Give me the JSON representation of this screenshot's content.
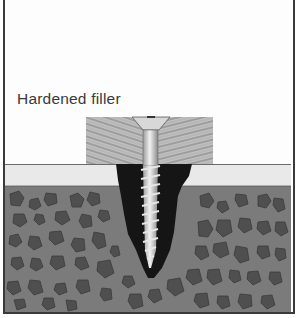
{
  "figure": {
    "label": "Hardened filler",
    "parts": [
      "wood-block",
      "screw",
      "hardened-filler-plug",
      "surface-layer",
      "concrete-with-aggregate"
    ]
  },
  "colors": {
    "border": "#3a3a3a",
    "label_text": "#3a3a3a",
    "wood_bg": "#bdbdbd",
    "wood_grain": "#8a8a8a",
    "surface_band": "#e9e9e9",
    "concrete": "#7b7b7b",
    "aggregate": "#555555",
    "filler": "#151515",
    "screw": "#d9d9d9"
  }
}
